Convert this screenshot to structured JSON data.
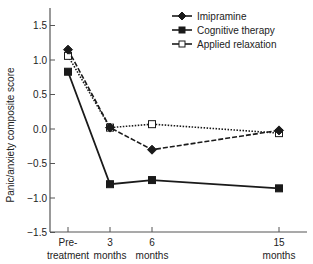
{
  "chart_data": {
    "type": "line",
    "title": "",
    "xlabel": "",
    "ylabel": "Panic/anxiety composite score",
    "ylim": [
      -1.5,
      1.75
    ],
    "yticks": [
      -1.5,
      -1.0,
      -0.5,
      0.0,
      0.5,
      1.0,
      1.5
    ],
    "ytick_labels": [
      "−1.5",
      "−1.0",
      "−0.5",
      "0.0",
      "0.5",
      "1.0",
      "1.5"
    ],
    "x": [
      0,
      3,
      6,
      15
    ],
    "categories": [
      "Pre-treatment",
      "3 months",
      "6 months",
      "15 months"
    ],
    "xtick_labels": [
      {
        "line1": "Pre-",
        "line2": "treatment"
      },
      {
        "line1": "3",
        "line2": "months"
      },
      {
        "line1": "6",
        "line2": "months"
      },
      {
        "line1": "15",
        "line2": "months"
      }
    ],
    "grid": false,
    "legend_position": "upper right",
    "series": [
      {
        "name": "Imipramine",
        "values": [
          1.15,
          0.02,
          -0.3,
          -0.02
        ],
        "marker": "diamond-filled",
        "line": "dashed"
      },
      {
        "name": "Cognitive therapy",
        "values": [
          0.83,
          -0.8,
          -0.74,
          -0.86
        ],
        "marker": "square-filled",
        "line": "solid"
      },
      {
        "name": "Applied relaxation",
        "values": [
          1.06,
          0.02,
          0.07,
          -0.06
        ],
        "marker": "square-open",
        "line": "dotted"
      }
    ]
  },
  "legend": {
    "items": [
      "Imipramine",
      "Cognitive therapy",
      "Applied relaxation"
    ]
  },
  "colors": {
    "line": "#1a1a1a",
    "axis": "#555555",
    "background": "#ffffff"
  }
}
